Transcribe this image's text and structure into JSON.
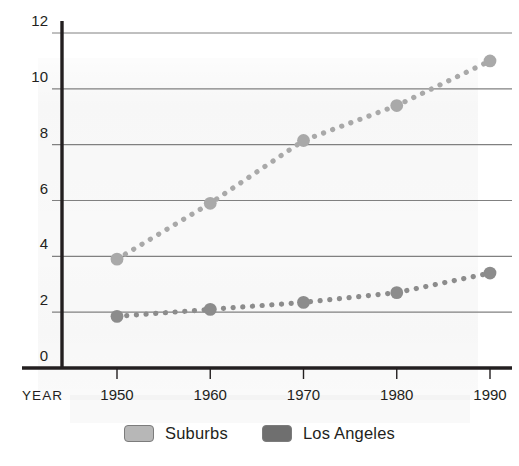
{
  "chart_data": {
    "type": "line",
    "title": "",
    "subtitle": "",
    "xlabel": "YEAR",
    "ylabel": "",
    "x": [
      1950,
      1960,
      1970,
      1980,
      1990
    ],
    "categories": [
      "1950",
      "1960",
      "1970",
      "1980",
      "1990"
    ],
    "xtick_labels": [
      "1950",
      "1960",
      "1970",
      "1980",
      "1990"
    ],
    "ytick_labels": [
      "0",
      "2",
      "4",
      "6",
      "8",
      "10",
      "12"
    ],
    "yticks": [
      0,
      2,
      4,
      6,
      8,
      10,
      12
    ],
    "ylim": [
      0,
      12
    ],
    "xlim": [
      1950,
      1990
    ],
    "grid": "horizontal",
    "legend_position": "bottom-center",
    "marker": "circle",
    "linestyle": "dotted",
    "series": [
      {
        "name": "Suburbs",
        "color": "#a9a9a9",
        "values": [
          3.9,
          5.9,
          8.15,
          9.4,
          11.0
        ]
      },
      {
        "name": "Los Angeles",
        "color": "#8c8c8c",
        "values": [
          1.85,
          2.1,
          2.35,
          2.7,
          3.4
        ]
      }
    ]
  },
  "legend": {
    "items": [
      {
        "label": "Suburbs",
        "swatch_color": "#b7b7b7"
      },
      {
        "label": "Los Angeles",
        "swatch_color": "#6f6f6f"
      }
    ]
  },
  "axis": {
    "x_axis_name": "YEAR"
  },
  "colors": {
    "axis": "#231f20",
    "gridline": "#808080",
    "text": "#231f20",
    "background": "#ffffff"
  }
}
